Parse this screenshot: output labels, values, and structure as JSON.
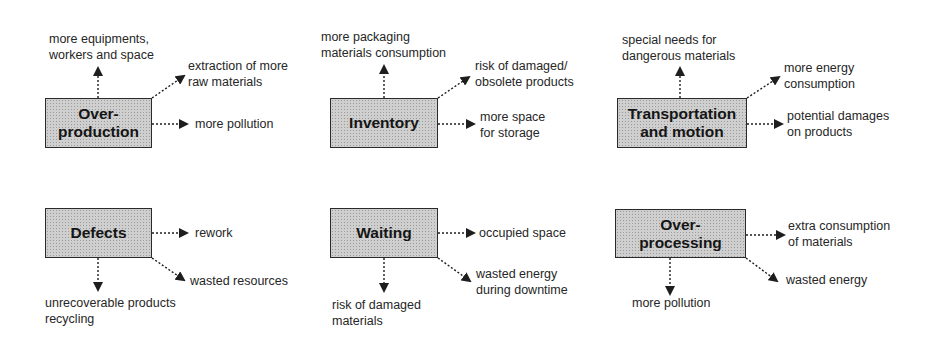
{
  "diagram": {
    "type": "seven-wastes-impacts",
    "wastes": [
      {
        "id": "overproduction",
        "title": "Over-\nproduction",
        "effects": {
          "up": "more equipments,\nworkers and space",
          "diag": "extraction of more\nraw materials",
          "right": "more pollution"
        }
      },
      {
        "id": "inventory",
        "title": "Inventory",
        "effects": {
          "up": "more packaging\nmaterials consumption",
          "diag": "risk of damaged/\nobsolete products",
          "right": "more space\nfor storage"
        }
      },
      {
        "id": "transportation",
        "title": "Transportation\nand motion",
        "effects": {
          "up": "special needs for\ndangerous materials",
          "diag": "more energy\nconsumption",
          "right": "potential damages\non products"
        }
      },
      {
        "id": "defects",
        "title": "Defects",
        "effects": {
          "right": "rework",
          "diag": "wasted resources",
          "down": "unrecoverable products\nrecycling"
        }
      },
      {
        "id": "waiting",
        "title": "Waiting",
        "effects": {
          "right": "occupied space",
          "diag": "wasted energy\nduring downtime",
          "down": "risk of damaged\nmaterials"
        }
      },
      {
        "id": "overprocessing",
        "title": "Over-\nprocessing",
        "effects": {
          "right": "extra consumption\nof materials",
          "diag": "wasted energy",
          "down": "more pollution"
        }
      }
    ],
    "colors": {
      "box_fill": "#cfcfcf",
      "box_border": "#2a2a2a",
      "text": "#1e1e1e",
      "arrow": "#1e1e1e"
    }
  }
}
